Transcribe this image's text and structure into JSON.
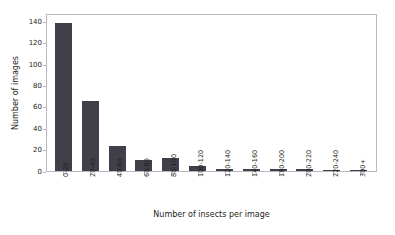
{
  "chart_data": {
    "type": "bar",
    "title": "",
    "xlabel": "Number of insects per image",
    "ylabel": "Number of images",
    "categories": [
      "0-20",
      "20-40",
      "40-60",
      "60-80",
      "80-100",
      "100-120",
      "120-140",
      "140-160",
      "180-200",
      "200-220",
      "220-240",
      "300+"
    ],
    "values": [
      139,
      66,
      23,
      10,
      12,
      5,
      2,
      2,
      2,
      2,
      1,
      1
    ],
    "ylim": [
      0,
      148
    ],
    "xlim_note": "categorical",
    "yticks": [
      0,
      20,
      40,
      60,
      80,
      100,
      120,
      140
    ],
    "ytick_labels": [
      "0",
      "20",
      "40",
      "60",
      "80",
      "100",
      "120",
      "140"
    ],
    "grid": false,
    "legend": null,
    "bar_color": "#3f4049",
    "axes_color": "#b8b8c0",
    "background": "#ffffff"
  }
}
